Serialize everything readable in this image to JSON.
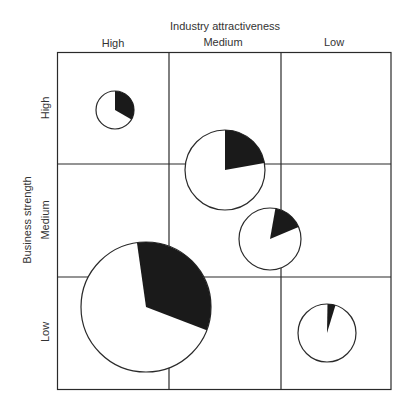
{
  "diagram": {
    "x_axis_title": "Industry attractiveness",
    "y_axis_title": "Business strength",
    "columns": [
      "High",
      "Medium",
      "Low"
    ],
    "rows": [
      "High",
      "Medium",
      "Low"
    ],
    "colors": {
      "line": "#2a2a2a",
      "fill": "#1a1a1a",
      "background": "#ffffff"
    }
  },
  "chart_data": {
    "type": "bubble-pie matrix",
    "title": "",
    "xlabel": "Industry attractiveness",
    "ylabel": "Business strength",
    "x_categories": [
      "High",
      "Medium",
      "Low"
    ],
    "y_categories": [
      "High",
      "Medium",
      "Low"
    ],
    "grid": "3x3",
    "bubbles": [
      {
        "name": "bubble-1",
        "cx": 115,
        "cy": 110,
        "r": 19,
        "share_start_deg": 0,
        "share_end_deg": 120,
        "cell": "High strength / High attractiveness"
      },
      {
        "name": "bubble-2",
        "cx": 225,
        "cy": 170,
        "r": 40,
        "share_start_deg": 0,
        "share_end_deg": 80,
        "cell": "High-Medium strength / Medium attractiveness"
      },
      {
        "name": "bubble-3",
        "cx": 270,
        "cy": 239,
        "r": 31,
        "share_start_deg": 10,
        "share_end_deg": 67,
        "cell": "Medium strength / Medium-Low attractiveness"
      },
      {
        "name": "bubble-4",
        "cx": 146,
        "cy": 307,
        "r": 65,
        "share_start_deg": -8,
        "share_end_deg": 111,
        "cell": "Medium-Low strength / High-Medium attractiveness"
      },
      {
        "name": "bubble-5",
        "cx": 327,
        "cy": 333,
        "r": 29,
        "share_start_deg": 1,
        "share_end_deg": 17,
        "cell": "Low strength / Low attractiveness"
      }
    ]
  }
}
